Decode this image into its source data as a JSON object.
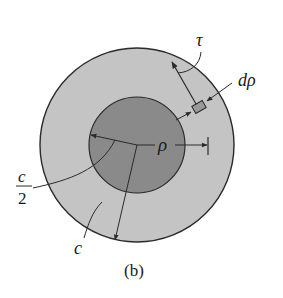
{
  "figure": {
    "caption": "(b)",
    "colors": {
      "background": "#ffffff",
      "outer_ring": "#c4c4c4",
      "inner_core": "#8a8a8a",
      "element": "#9a9a9a",
      "stroke": "#2a2a2a"
    },
    "labels": {
      "tau": "τ",
      "d_rho": "dρ",
      "rho": "ρ",
      "c_half_numerator": "c",
      "c_half_denominator": "2",
      "c": "c"
    },
    "geometry": {
      "center": [
        137,
        145
      ],
      "outer_radius": 97,
      "inner_radius": 48
    }
  }
}
